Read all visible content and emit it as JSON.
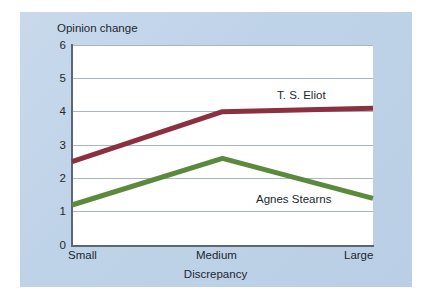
{
  "figure": {
    "panel_background": "#bed2e8",
    "plot_background": "#ffffff"
  },
  "chart_data": {
    "type": "line",
    "title": "",
    "xlabel": "Discrepancy",
    "ylabel": "Opinion change",
    "categories": [
      "Small",
      "Medium",
      "Large"
    ],
    "xticklabels": [
      "Small",
      "Medium",
      "Large"
    ],
    "yticklabels": [
      "0",
      "1",
      "2",
      "3",
      "4",
      "5",
      "6"
    ],
    "ylim": [
      0,
      6
    ],
    "ytick_values": [
      0,
      1,
      2,
      3,
      4,
      5,
      6
    ],
    "grid": "horizontal",
    "legend_position": "inline-annotations",
    "series": [
      {
        "name": "T. S. Eliot",
        "color": "#8c2f3f",
        "values": [
          2.5,
          4.0,
          4.1
        ],
        "label_text": "T. S. Eliot"
      },
      {
        "name": "Agnes Stearns",
        "color": "#5c8a3c",
        "values": [
          1.2,
          2.6,
          1.4
        ],
        "label_text": "Agnes Stearns"
      }
    ]
  }
}
